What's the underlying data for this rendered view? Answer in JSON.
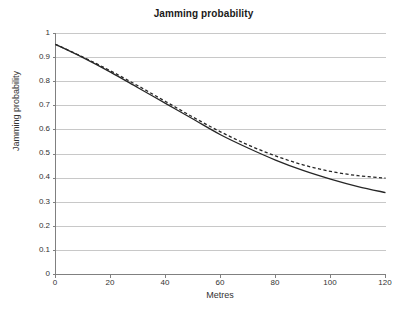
{
  "chart_data": {
    "type": "line",
    "title": "Jamming probability",
    "xlabel": "Metres",
    "ylabel": "Jamming probability",
    "xlim": [
      0,
      120
    ],
    "ylim": [
      0,
      1
    ],
    "grid": "horizontal",
    "legend": "none",
    "xticks": [
      "0",
      "20",
      "40",
      "60",
      "80",
      "100",
      "120"
    ],
    "yticks": [
      "0",
      "0.1",
      "0.2",
      "0.3",
      "0.4",
      "0.5",
      "0.6",
      "0.7",
      "0.8",
      "0.9",
      "1"
    ],
    "x": [
      0,
      10,
      20,
      30,
      40,
      50,
      60,
      70,
      80,
      90,
      100,
      110,
      120
    ],
    "series": [
      {
        "name": "solid-curve",
        "style": "solid",
        "color": "#262626",
        "values": [
          0.955,
          0.9,
          0.84,
          0.775,
          0.71,
          0.645,
          0.58,
          0.525,
          0.475,
          0.432,
          0.396,
          0.365,
          0.34
        ]
      },
      {
        "name": "dashed-curve",
        "style": "dashed",
        "color": "#262626",
        "values": [
          0.955,
          0.902,
          0.845,
          0.783,
          0.718,
          0.653,
          0.592,
          0.538,
          0.492,
          0.455,
          0.428,
          0.41,
          0.4
        ]
      }
    ]
  },
  "axes": {
    "grid_color": "#c8c8c8",
    "axis_color": "#808080"
  }
}
